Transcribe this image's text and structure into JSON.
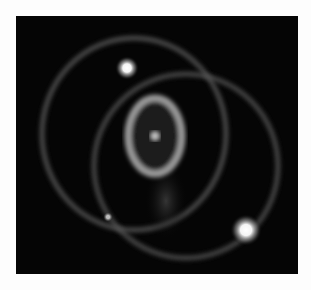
{
  "image": {
    "subject": "astronomical image of ring nebula with three rings and bright stars",
    "background_color": "#050505",
    "page_background": "#fdfdfd",
    "inner_ring": {
      "cx": 139,
      "cy": 120,
      "rx": 27,
      "ry": 38,
      "color": "#a8a8a8"
    },
    "central_source": {
      "cx": 139,
      "cy": 120
    },
    "outer_rings": [
      {
        "cx": 118,
        "cy": 118,
        "r": 95
      },
      {
        "cx": 168,
        "cy": 150,
        "r": 95
      }
    ],
    "stars": [
      {
        "cx": 111,
        "cy": 52,
        "r": 7
      },
      {
        "cx": 230,
        "cy": 214,
        "r": 9
      },
      {
        "cx": 92,
        "cy": 201,
        "r": 3
      }
    ]
  }
}
